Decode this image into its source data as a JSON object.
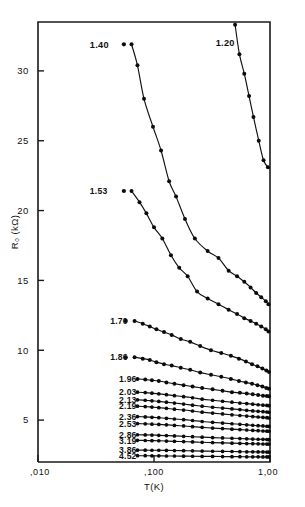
{
  "chart_data": {
    "type": "line",
    "title": "",
    "xlabel": "T(K)",
    "ylabel": "R₀ (kΩ)",
    "xscale": "log",
    "yscale": "linear",
    "xlim": [
      0.01,
      1.0
    ],
    "ylim": [
      2.0,
      33.5
    ],
    "grid": false,
    "legend_position": "inline-left-labels",
    "xticks": [
      0.01,
      0.1,
      1.0
    ],
    "xticklabels": [
      ",010",
      ",100",
      "1,00"
    ],
    "yticks": [
      5,
      10,
      15,
      20,
      25,
      30
    ],
    "yticklabels": [
      "5",
      "10",
      "15",
      "20",
      "25",
      "30"
    ],
    "series": [
      {
        "name": "1.20",
        "label": "1.20",
        "label_x": 0.34,
        "label_y": 32.0,
        "x": [
          0.5,
          0.545,
          0.6,
          0.66,
          0.72,
          0.8,
          0.88,
          0.96
        ],
        "y": [
          33.3,
          31.2,
          29.8,
          28.2,
          26.7,
          25.0,
          23.6,
          23.1
        ]
      },
      {
        "name": "1.40",
        "label": "1.40",
        "label_x": 0.028,
        "label_y": 31.9,
        "x": [
          0.064,
          0.072,
          0.082,
          0.098,
          0.115,
          0.135,
          0.155,
          0.185,
          0.225,
          0.29,
          0.36,
          0.44,
          0.52,
          0.6,
          0.68,
          0.76,
          0.84,
          0.92,
          0.97
        ],
        "y": [
          31.9,
          30.4,
          28.0,
          26.0,
          24.3,
          22.1,
          21.0,
          19.4,
          18.0,
          17.1,
          16.6,
          15.7,
          15.3,
          14.9,
          14.5,
          14.1,
          13.8,
          13.5,
          13.3
        ]
      },
      {
        "name": "1.53",
        "label": "1.53",
        "label_x": 0.028,
        "label_y": 21.4,
        "x": [
          0.064,
          0.075,
          0.086,
          0.1,
          0.118,
          0.14,
          0.165,
          0.195,
          0.235,
          0.29,
          0.36,
          0.44,
          0.52,
          0.6,
          0.68,
          0.76,
          0.84,
          0.92,
          0.97
        ],
        "y": [
          21.4,
          20.6,
          19.8,
          18.8,
          18.0,
          16.8,
          15.9,
          15.3,
          14.2,
          13.7,
          13.3,
          12.9,
          12.6,
          12.3,
          12.1,
          11.9,
          11.7,
          11.5,
          11.35
        ]
      },
      {
        "name": "1.70",
        "label": "1.70",
        "label_x": 0.042,
        "label_y": 12.1,
        "x": [
          0.068,
          0.08,
          0.092,
          0.105,
          0.122,
          0.142,
          0.17,
          0.205,
          0.25,
          0.31,
          0.38,
          0.46,
          0.54,
          0.62,
          0.7,
          0.78,
          0.86,
          0.93,
          0.98
        ],
        "y": [
          12.1,
          11.9,
          11.7,
          11.5,
          11.3,
          11.1,
          10.8,
          10.6,
          10.3,
          10.0,
          9.8,
          9.6,
          9.4,
          9.2,
          9.0,
          8.85,
          8.7,
          8.55,
          8.45
        ]
      },
      {
        "name": "1.86",
        "label": "1.86",
        "label_x": 0.042,
        "label_y": 9.5,
        "x": [
          0.068,
          0.08,
          0.092,
          0.105,
          0.122,
          0.142,
          0.17,
          0.205,
          0.25,
          0.31,
          0.38,
          0.46,
          0.54,
          0.62,
          0.7,
          0.78,
          0.86,
          0.93,
          0.98
        ],
        "y": [
          9.5,
          9.4,
          9.3,
          9.15,
          9.0,
          8.9,
          8.75,
          8.6,
          8.4,
          8.25,
          8.1,
          7.95,
          7.8,
          7.7,
          7.6,
          7.5,
          7.4,
          7.3,
          7.25
        ]
      },
      {
        "name": "1.96",
        "label": "1.96",
        "label_x": 0.05,
        "label_y": 7.95,
        "x": [
          0.072,
          0.084,
          0.096,
          0.11,
          0.128,
          0.15,
          0.18,
          0.215,
          0.26,
          0.32,
          0.39,
          0.47,
          0.55,
          0.63,
          0.71,
          0.79,
          0.87,
          0.94,
          0.98
        ],
        "y": [
          7.95,
          7.9,
          7.85,
          7.8,
          7.7,
          7.6,
          7.5,
          7.4,
          7.3,
          7.2,
          7.1,
          7.0,
          6.95,
          6.9,
          6.85,
          6.8,
          6.75,
          6.72,
          6.7
        ]
      },
      {
        "name": "2.03",
        "label": "2.03",
        "label_x": 0.05,
        "label_y": 7.0,
        "x": [
          0.072,
          0.084,
          0.096,
          0.11,
          0.128,
          0.15,
          0.18,
          0.215,
          0.26,
          0.32,
          0.39,
          0.47,
          0.55,
          0.63,
          0.71,
          0.79,
          0.87,
          0.94,
          0.98
        ],
        "y": [
          7.0,
          6.97,
          6.93,
          6.88,
          6.82,
          6.75,
          6.68,
          6.6,
          6.5,
          6.42,
          6.35,
          6.28,
          6.22,
          6.18,
          6.14,
          6.1,
          6.07,
          6.05,
          6.03
        ]
      },
      {
        "name": "2.13",
        "label": "2.13",
        "label_x": 0.05,
        "label_y": 6.45,
        "x": [
          0.072,
          0.084,
          0.096,
          0.11,
          0.128,
          0.15,
          0.18,
          0.215,
          0.26,
          0.32,
          0.39,
          0.47,
          0.55,
          0.63,
          0.71,
          0.79,
          0.87,
          0.94,
          0.98
        ],
        "y": [
          6.45,
          6.42,
          6.38,
          6.34,
          6.28,
          6.22,
          6.15,
          6.07,
          6.0,
          5.92,
          5.86,
          5.8,
          5.75,
          5.7,
          5.66,
          5.63,
          5.6,
          5.58,
          5.56
        ]
      },
      {
        "name": "2.19",
        "label": "2.19",
        "label_x": 0.05,
        "label_y": 6.0,
        "x": [
          0.072,
          0.084,
          0.096,
          0.11,
          0.128,
          0.15,
          0.18,
          0.215,
          0.26,
          0.32,
          0.39,
          0.47,
          0.55,
          0.63,
          0.71,
          0.79,
          0.87,
          0.94,
          0.98
        ],
        "y": [
          6.0,
          5.97,
          5.93,
          5.89,
          5.84,
          5.78,
          5.72,
          5.65,
          5.57,
          5.5,
          5.44,
          5.38,
          5.33,
          5.29,
          5.25,
          5.22,
          5.19,
          5.17,
          5.15
        ]
      },
      {
        "name": "2.36",
        "label": "2.36",
        "label_x": 0.05,
        "label_y": 5.25,
        "x": [
          0.072,
          0.084,
          0.096,
          0.11,
          0.128,
          0.15,
          0.18,
          0.215,
          0.26,
          0.32,
          0.39,
          0.47,
          0.55,
          0.63,
          0.71,
          0.79,
          0.87,
          0.94,
          0.98
        ],
        "y": [
          5.25,
          5.23,
          5.2,
          5.17,
          5.13,
          5.08,
          5.03,
          4.97,
          4.9,
          4.84,
          4.79,
          4.74,
          4.7,
          4.66,
          4.63,
          4.6,
          4.58,
          4.56,
          4.55
        ]
      },
      {
        "name": "2.53",
        "label": "2.53",
        "label_x": 0.05,
        "label_y": 4.75,
        "x": [
          0.072,
          0.084,
          0.096,
          0.11,
          0.128,
          0.15,
          0.18,
          0.215,
          0.26,
          0.32,
          0.39,
          0.47,
          0.55,
          0.63,
          0.71,
          0.79,
          0.87,
          0.94,
          0.98
        ],
        "y": [
          4.75,
          4.73,
          4.71,
          4.69,
          4.66,
          4.62,
          4.58,
          4.53,
          4.48,
          4.43,
          4.39,
          4.35,
          4.32,
          4.29,
          4.26,
          4.24,
          4.22,
          4.21,
          4.2
        ]
      },
      {
        "name": "2.86",
        "label": "2.86",
        "label_x": 0.05,
        "label_y": 3.95,
        "x": [
          0.072,
          0.084,
          0.096,
          0.11,
          0.128,
          0.15,
          0.18,
          0.215,
          0.26,
          0.32,
          0.39,
          0.47,
          0.55,
          0.63,
          0.71,
          0.79,
          0.87,
          0.94,
          0.98
        ],
        "y": [
          3.95,
          3.94,
          3.93,
          3.91,
          3.89,
          3.87,
          3.84,
          3.81,
          3.78,
          3.75,
          3.72,
          3.7,
          3.68,
          3.66,
          3.64,
          3.63,
          3.62,
          3.61,
          3.6
        ]
      },
      {
        "name": "3.19",
        "label": "3.19",
        "label_x": 0.05,
        "label_y": 3.55,
        "x": [
          0.072,
          0.084,
          0.096,
          0.11,
          0.128,
          0.15,
          0.18,
          0.215,
          0.26,
          0.32,
          0.39,
          0.47,
          0.55,
          0.63,
          0.71,
          0.79,
          0.87,
          0.94,
          0.98
        ],
        "y": [
          3.55,
          3.54,
          3.53,
          3.52,
          3.5,
          3.48,
          3.46,
          3.44,
          3.41,
          3.39,
          3.37,
          3.35,
          3.33,
          3.32,
          3.31,
          3.3,
          3.29,
          3.28,
          3.28
        ]
      },
      {
        "name": "3.86",
        "label": "3.86",
        "label_x": 0.05,
        "label_y": 2.85,
        "x": [
          0.072,
          0.084,
          0.096,
          0.11,
          0.128,
          0.15,
          0.18,
          0.215,
          0.26,
          0.32,
          0.39,
          0.47,
          0.55,
          0.63,
          0.71,
          0.79,
          0.87,
          0.94,
          0.98
        ],
        "y": [
          2.85,
          2.85,
          2.84,
          2.84,
          2.83,
          2.82,
          2.81,
          2.8,
          2.78,
          2.77,
          2.76,
          2.75,
          2.74,
          2.73,
          2.73,
          2.72,
          2.72,
          2.71,
          2.71
        ]
      },
      {
        "name": "4.52",
        "label": "4.52",
        "label_x": 0.05,
        "label_y": 2.45,
        "x": [
          0.072,
          0.084,
          0.096,
          0.11,
          0.128,
          0.15,
          0.18,
          0.215,
          0.26,
          0.32,
          0.39,
          0.47,
          0.55,
          0.63,
          0.71,
          0.79,
          0.87,
          0.94,
          0.98
        ],
        "y": [
          2.45,
          2.45,
          2.44,
          2.44,
          2.43,
          2.43,
          2.42,
          2.41,
          2.4,
          2.4,
          2.39,
          2.38,
          2.38,
          2.37,
          2.37,
          2.37,
          2.36,
          2.36,
          2.36
        ]
      }
    ],
    "stray_points": [
      {
        "series": "1.40",
        "x": 0.055,
        "y": 31.9
      },
      {
        "series": "1.53",
        "x": 0.055,
        "y": 21.4
      },
      {
        "series": "1.70",
        "x": 0.057,
        "y": 12.1
      },
      {
        "series": "1.86",
        "x": 0.057,
        "y": 9.5
      }
    ]
  },
  "axes": {
    "y_title": "R₀ (kΩ)",
    "x_title": "T(K)"
  }
}
